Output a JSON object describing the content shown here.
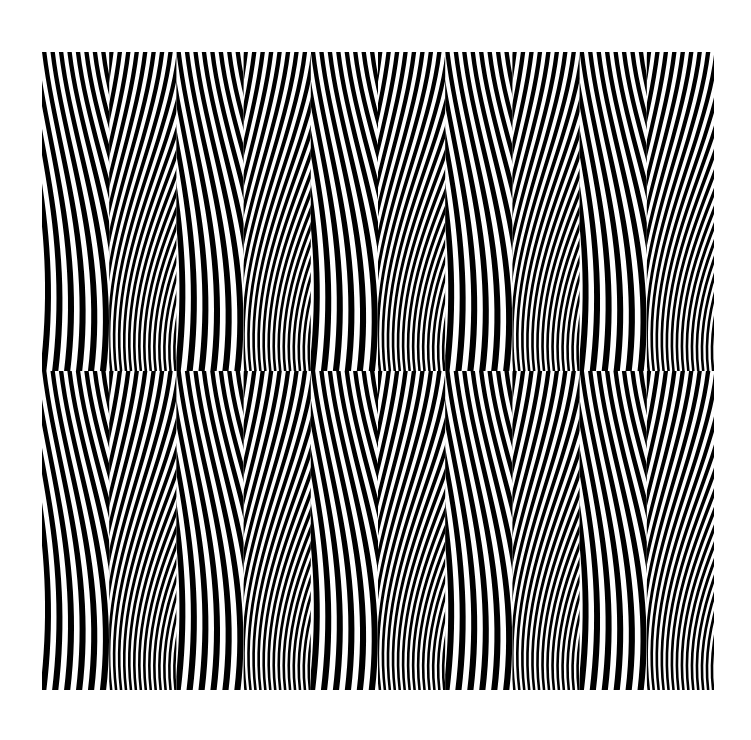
{
  "page": {
    "width": 751,
    "height": 740,
    "background_color": "#ffffff",
    "medium": "ink-on-paper-drawing"
  },
  "artwork": {
    "name": "nested-chevron-flame-moire",
    "x": 42,
    "y": 52,
    "width": 672,
    "height": 638,
    "ink_color": "#000000",
    "paper_color": "#ffffff",
    "description": "Black and white optical-art field of dense curved stripes organized into a grid of mirrored tiles forming vertical flame or leaf shapes"
  },
  "chart_data": {
    "type": "heatmap",
    "subtitle": "",
    "xlabel": "",
    "ylabel": "",
    "grid": false,
    "legend_position": "none",
    "colors": {
      "ink": "#000000",
      "paper": "#ffffff"
    },
    "geometry": {
      "tile_columns": 10,
      "tile_rows": 2,
      "tile_width": 67.2,
      "tile_height": 319.0,
      "stripe_period_px": 8.45,
      "stripe_duty_cycle": 0.52,
      "stripes_per_tile": 8,
      "curve_bend_amplitude": 0.92,
      "mirror_axis_x": 378,
      "mirror_seam_y": 371
    },
    "column_handedness": [
      1,
      -1,
      1,
      -1,
      1,
      -1,
      1,
      -1,
      1,
      -1
    ],
    "column_centers_x": [
      75.6,
      142.8,
      210.0,
      277.2,
      344.4,
      411.6,
      478.8,
      546.0,
      613.2,
      680.4
    ],
    "row_centers_y": [
      211.5,
      530.5
    ],
    "series": [
      {
        "name": "upper-band",
        "row_index": 0,
        "y_top": 52,
        "y_bottom": 371,
        "values": [
          1,
          -1,
          1,
          -1,
          1,
          -1,
          1,
          -1,
          1,
          -1
        ]
      },
      {
        "name": "lower-band",
        "row_index": 1,
        "y_top": 371,
        "y_bottom": 690,
        "values": [
          1,
          -1,
          1,
          -1,
          1,
          -1,
          1,
          -1,
          1,
          -1
        ]
      }
    ],
    "annotations": [
      {
        "label": "central-flame-motif",
        "x": 378,
        "y": 300
      },
      {
        "label": "central-flame-motif",
        "x": 378,
        "y": 619
      },
      {
        "label": "horizontal-mirror-seam",
        "x": 378,
        "y": 371
      }
    ]
  },
  "labels": {
    "artwork_caption": "",
    "signature": ""
  }
}
